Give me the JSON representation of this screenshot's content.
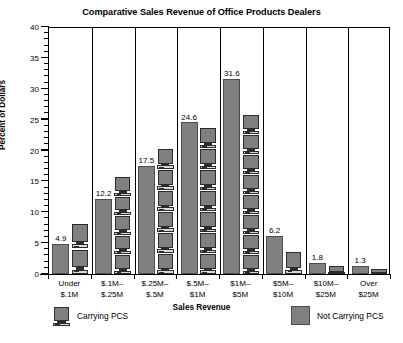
{
  "chart_data": {
    "type": "bar",
    "title": "Comparative Sales Revenue of Office Products Dealers",
    "xlabel": "Sales Revenue",
    "ylabel": "Percent of Dollars",
    "categories": [
      "Under\n$.1M",
      "$.1M–\n$.25M",
      "$.25M–\n$.5M",
      "$.5M–\n$1M",
      "$1M–\n$5M",
      "$5M–\n$10M",
      "$10M–\n$25M",
      "Over\n$25M"
    ],
    "category_lines": [
      [
        "Under",
        "$.1M"
      ],
      [
        "$.1M–",
        "$.25M"
      ],
      [
        "$.25M–",
        "$.5M"
      ],
      [
        "$.5M–",
        "$1M"
      ],
      [
        "$1M–",
        "$5M"
      ],
      [
        "$5M–",
        "$10M"
      ],
      [
        "$10M–",
        "$25M"
      ],
      [
        "Over",
        "$25M"
      ]
    ],
    "series": [
      {
        "name": "Not Carrying PCS",
        "style": "solid-gray",
        "color": "#808080",
        "values": [
          4.9,
          12.2,
          17.5,
          24.6,
          31.6,
          6.2,
          1.8,
          1.3
        ]
      },
      {
        "name": "Carrying PCS",
        "style": "computer-icon-stack",
        "color": "#808080",
        "values": [
          8.2,
          15.8,
          20.4,
          23.7,
          25.9,
          3.7,
          1.3,
          0.9
        ]
      }
    ],
    "ylim": [
      0,
      40
    ],
    "ytick_major": [
      0,
      5,
      10,
      15,
      20,
      25,
      30,
      35,
      40
    ],
    "ytick_minor_step": 1,
    "grid": false,
    "category_dividers": true,
    "legend_position": "bottom"
  },
  "legend": {
    "carrying_label": "Carrying PCS",
    "not_carrying_label": "Not Carrying PCS"
  }
}
